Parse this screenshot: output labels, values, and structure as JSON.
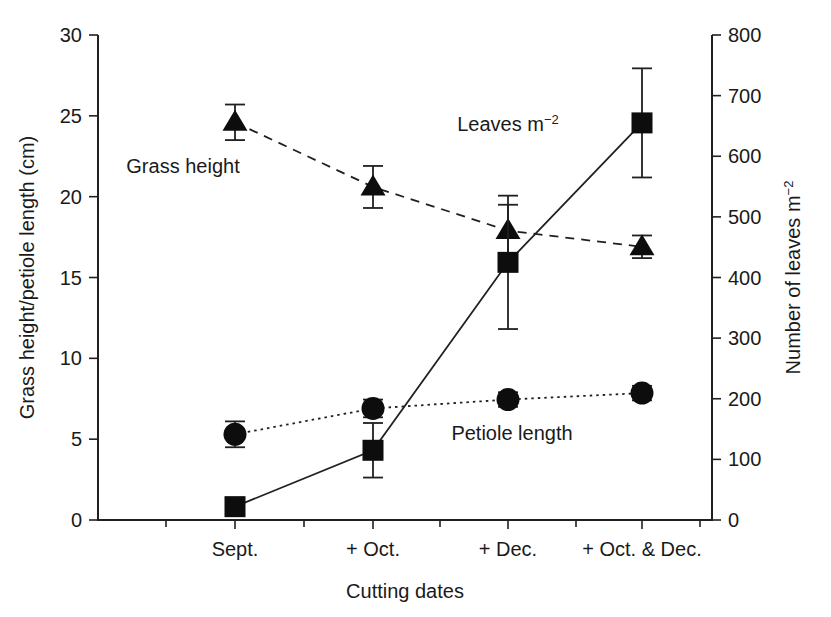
{
  "chart_data": {
    "type": "line",
    "title": "",
    "xlabel": "Cutting dates",
    "ylabel": "Grass height/petiole length (cm)",
    "ylabel_right": "Number of leaves m⁻²",
    "categories": [
      "Sept.",
      "+ Oct.",
      "+ Dec.",
      "+ Oct. & Dec."
    ],
    "ylim": [
      0,
      30
    ],
    "yticks": [
      0,
      5,
      10,
      15,
      20,
      25,
      30
    ],
    "ytick_labels": [
      "0",
      "5",
      "10",
      "15",
      "20",
      "25",
      "30"
    ],
    "ylim_right": [
      0,
      800
    ],
    "yticks_right": [
      0,
      100,
      200,
      300,
      400,
      500,
      600,
      700,
      800
    ],
    "ytick_labels_right": [
      "0",
      "100",
      "200",
      "300",
      "400",
      "500",
      "600",
      "700",
      "800"
    ],
    "grid": false,
    "legend_position": "inline-annotations",
    "series": [
      {
        "name": "Grass height",
        "axis": "left",
        "unit": "cm",
        "marker": "triangle",
        "linestyle": "dashed",
        "values": [
          24.6,
          20.6,
          17.9,
          16.9
        ],
        "errors": [
          1.1,
          1.3,
          1.6,
          0.7
        ],
        "label": "Grass height"
      },
      {
        "name": "Petiole length",
        "axis": "left",
        "unit": "cm",
        "marker": "circle",
        "linestyle": "dotted",
        "values": [
          5.3,
          6.9,
          7.45,
          7.85
        ],
        "errors": [
          0.8,
          0.55,
          0.45,
          0.45
        ],
        "label": "Petiole length"
      },
      {
        "name": "Leaves m-2",
        "axis": "right",
        "unit": "leaves m⁻²",
        "marker": "square",
        "linestyle": "solid",
        "values": [
          22,
          115,
          425,
          655
        ],
        "errors": [
          13,
          45,
          110,
          90
        ],
        "label": "Leaves m",
        "label_sup": "−2"
      }
    ],
    "annotations": [
      {
        "text": "Grass height",
        "x_px": 183,
        "y_px": 173
      },
      {
        "text": "Leaves m",
        "sup": "−2",
        "x_px": 508,
        "y_px": 131
      },
      {
        "text": "Petiole length",
        "x_px": 512,
        "y_px": 440
      }
    ]
  }
}
